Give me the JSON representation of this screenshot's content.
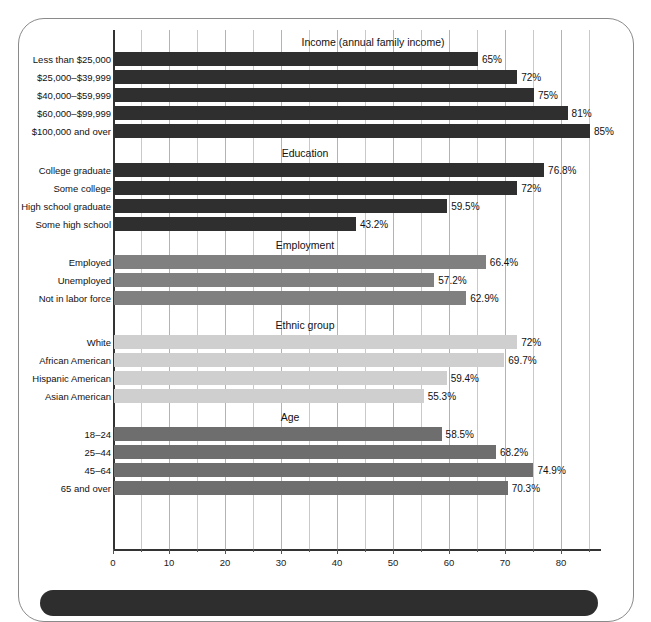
{
  "chart_data": {
    "type": "bar",
    "orientation": "horizontal",
    "title": "",
    "xlabel": "",
    "ylabel": "",
    "xlim": [
      0,
      87
    ],
    "xticks": [
      0,
      10,
      20,
      30,
      40,
      50,
      60,
      70,
      80
    ],
    "xtick_labels": [
      "0",
      "10",
      "20",
      "30",
      "40",
      "50",
      "60",
      "70",
      "80"
    ],
    "minor_tick_step": 5,
    "grid": true,
    "legend": "none",
    "value_suffix": "%",
    "groups": [
      {
        "name": "Income (annual family income)",
        "color": "#2f2f2f",
        "categories": [
          "Less than $25,000",
          "$25,000–$39,999",
          "$40,000–$59,999",
          "$60,000–$99,999",
          "$100,000 and over"
        ],
        "values": [
          65,
          72,
          75,
          81,
          85
        ],
        "labels": [
          "65%",
          "72%",
          "75%",
          "81%",
          "85%"
        ]
      },
      {
        "name": "Education",
        "color": "#2f2f2f",
        "categories": [
          "College graduate",
          "Some college",
          "High school graduate",
          "Some high school"
        ],
        "values": [
          76.8,
          72,
          59.5,
          43.2
        ],
        "labels": [
          "76.8%",
          "72%",
          "59.5%",
          "43.2%"
        ]
      },
      {
        "name": "Employment",
        "color": "#808080",
        "categories": [
          "Employed",
          "Unemployed",
          "Not in labor force"
        ],
        "values": [
          66.4,
          57.2,
          62.9
        ],
        "labels": [
          "66.4%",
          "57.2%",
          "62.9%"
        ]
      },
      {
        "name": "Ethnic group",
        "color": "#cfcfcf",
        "categories": [
          "White",
          "African American",
          "Hispanic American",
          "Asian American"
        ],
        "values": [
          72,
          69.7,
          59.4,
          55.3
        ],
        "labels": [
          "72%",
          "69.7%",
          "59.4%",
          "55.3%"
        ]
      },
      {
        "name": "Age",
        "color": "#6e6e6e",
        "categories": [
          "18–24",
          "25–44",
          "45–64",
          "65 and over"
        ],
        "values": [
          58.5,
          68.2,
          74.9,
          70.3
        ],
        "labels": [
          "58.5%",
          "68.2%",
          "74.9%",
          "70.3%"
        ]
      }
    ]
  },
  "colors": {
    "frame_border": "#8a8a8a",
    "bottom_band": "#2e2e2e",
    "axis": "#333333",
    "gridline": "#c9c9c9",
    "text": "#111111"
  }
}
